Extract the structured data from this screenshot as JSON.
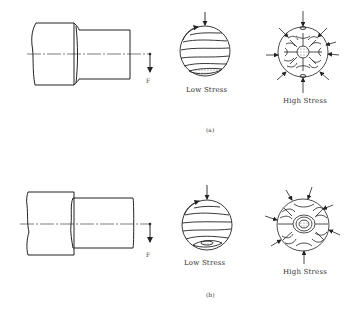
{
  "figure": {
    "panels": [
      {
        "caption": "(a)",
        "force_label": "F",
        "low_stress_label": "Low Stress",
        "high_stress_label": "High Stress"
      },
      {
        "caption": "(b)",
        "force_label": "F",
        "low_stress_label": "Low Stress",
        "high_stress_label": "High Stress"
      }
    ]
  },
  "colors": {
    "line": "#222222",
    "background": "#ffffff"
  }
}
